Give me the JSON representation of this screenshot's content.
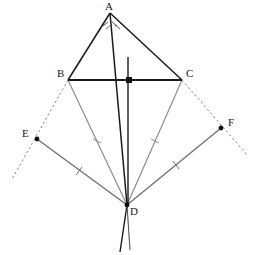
{
  "figure": {
    "width": 258,
    "height": 255,
    "background_color": "#ffffff"
  },
  "colors": {
    "solid_black": "#1a1a1a",
    "medium_gray": "#6e6e6e",
    "light_gray": "#8c8c8c",
    "dashed_gray": "#8a8a8a",
    "label_color": "#1a1a1a",
    "point_marker": "#111111"
  },
  "points": [
    {
      "name": "A",
      "x": 110,
      "y": 13,
      "label": "A",
      "label_x": 105,
      "label_y": 2,
      "marker": "none"
    },
    {
      "name": "B",
      "x": 68,
      "y": 80,
      "label": "B",
      "label_x": 58,
      "label_y": 69,
      "marker": "none"
    },
    {
      "name": "C",
      "x": 182,
      "y": 80,
      "label": "C",
      "label_x": 185,
      "label_y": 69,
      "marker": "none"
    },
    {
      "name": "D",
      "x": 127,
      "y": 205,
      "label": "D",
      "label_x": 129,
      "label_y": 207,
      "marker": "dot"
    },
    {
      "name": "E",
      "x": 37,
      "y": 139,
      "label": "E",
      "label_x": 24,
      "label_y": 128,
      "marker": "dot"
    },
    {
      "name": "F",
      "x": 221,
      "y": 128,
      "label": "F",
      "label_x": 227,
      "label_y": 117,
      "marker": "dot"
    },
    {
      "name": "M",
      "x": 129,
      "y": 80,
      "label": "",
      "label_x": 0,
      "label_y": 0,
      "marker": "square"
    }
  ],
  "segments": [
    {
      "name": "AB",
      "from": "A",
      "to": "B",
      "style": "solid",
      "color": "#1a1a1a",
      "width": 1.5
    },
    {
      "name": "AC",
      "from": "A",
      "to": "C",
      "style": "solid",
      "color": "#1a1a1a",
      "width": 1.5
    },
    {
      "name": "BC",
      "from": "B",
      "to": "C",
      "style": "solid",
      "color": "#1a1a1a",
      "width": 1.8
    },
    {
      "name": "AD",
      "from": "A",
      "to": "D",
      "style": "solid",
      "color": "#1a1a1a",
      "width": 1.5
    },
    {
      "name": "BD",
      "from": "B",
      "to": "D",
      "style": "solid",
      "color": "#8c8c8c",
      "width": 1.2
    },
    {
      "name": "CD",
      "from": "C",
      "to": "D",
      "style": "solid",
      "color": "#8c8c8c",
      "width": 1.2
    },
    {
      "name": "ED",
      "from": "E",
      "to": "D",
      "style": "solid",
      "color": "#6e6e6e",
      "width": 1.3
    },
    {
      "name": "FD",
      "from": "F",
      "to": "D",
      "style": "solid",
      "color": "#6e6e6e",
      "width": 1.3
    }
  ],
  "dashed_rays": [
    {
      "name": "ray-B-E-extended",
      "x1": 68,
      "y1": 80,
      "x2": 12,
      "y2": 179,
      "color": "#8a8a8a"
    },
    {
      "name": "ray-C-F-extended",
      "x1": 182,
      "y1": 80,
      "x2": 248,
      "y2": 156,
      "color": "#8a8a8a"
    }
  ],
  "axis_lines": [
    {
      "name": "vertical-axis-upper",
      "x1": 128,
      "y1": 57,
      "x2": 128,
      "y2": 205,
      "color": "#1a1a1a",
      "width": 1.4
    },
    {
      "name": "vertical-axis-lower-left",
      "x1": 127,
      "y1": 205,
      "x2": 120,
      "y2": 252,
      "color": "#1a1a1a",
      "width": 1.4
    },
    {
      "name": "vertical-axis-lower-right",
      "x1": 127,
      "y1": 205,
      "x2": 130,
      "y2": 250,
      "color": "#555555",
      "width": 1.2
    }
  ],
  "tick_marks": [
    {
      "name": "tick-BD",
      "x": 97,
      "y": 141,
      "angle": 57,
      "color": "#8c8c8c"
    },
    {
      "name": "tick-CD",
      "x": 155,
      "y": 141,
      "angle": -62,
      "color": "#8c8c8c"
    },
    {
      "name": "tick-ED",
      "x": 79,
      "y": 171,
      "angle": 36,
      "color": "#6e6e6e"
    },
    {
      "name": "tick-FD",
      "x": 176,
      "y": 165,
      "angle": -38,
      "color": "#6e6e6e"
    }
  ],
  "angle_marks": [
    {
      "name": "angle-mark-A-left",
      "x": 106,
      "y": 24,
      "angle": 70,
      "color": "#555555"
    },
    {
      "name": "angle-mark-A-right",
      "x": 114,
      "y": 24,
      "angle": -70,
      "color": "#555555"
    }
  ],
  "right_angle_marker": {
    "name": "right-angle-at-M",
    "x": 129,
    "y": 80,
    "size": 5,
    "color": "#111111"
  },
  "labels": {
    "A": "A",
    "B": "B",
    "C": "C",
    "D": "D",
    "E": "E",
    "F": "F"
  }
}
